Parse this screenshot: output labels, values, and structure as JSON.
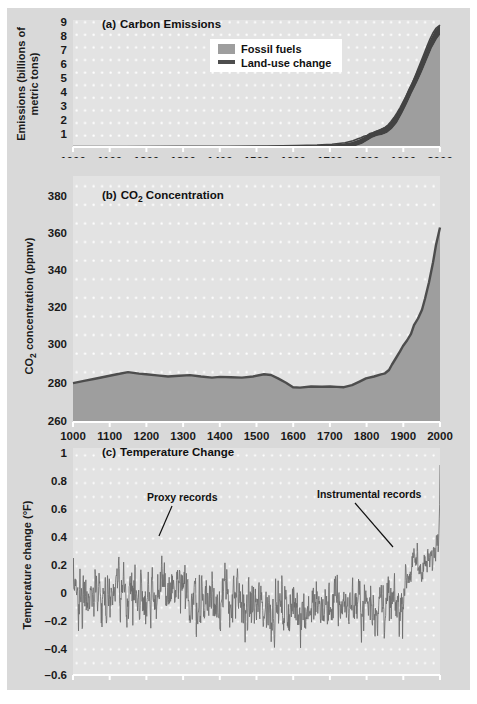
{
  "figure": {
    "background_color": "#d9d9d9",
    "plot_background_color": "#e3e3e3",
    "grid_color": "#ffffff",
    "axis_color": "#ffffff",
    "line_color": "#4d4d4d",
    "fill_color": "#9a9a9a",
    "dark_fill_color": "#3d3d3d"
  },
  "panel_a": {
    "title_prefix": "(a)",
    "title": "Carbon Emissions",
    "ylabel_line1": "Emissions (billions of",
    "ylabel_line2": "metric tons)",
    "yticks": [
      "9",
      "8",
      "7",
      "6",
      "5",
      "4",
      "3",
      "2",
      "1"
    ],
    "xticks": [
      "1000",
      "1100",
      "1200",
      "1300",
      "1400",
      "1500",
      "1600",
      "1700",
      "1800",
      "1900",
      "2000"
    ],
    "legend": [
      {
        "label": "Fossil fuels",
        "marker": "swatch",
        "color": "#9a9a9a"
      },
      {
        "label": "Land-use change",
        "marker": "line",
        "color": "#4d4d4d"
      }
    ]
  },
  "panel_b": {
    "title_prefix": "(b)",
    "title_main": "CO",
    "title_sub": "2",
    "title_rest": " Concentration",
    "ylabel_main": "CO",
    "ylabel_sub": "2",
    "ylabel_rest": " concentration (ppmv)",
    "yticks": [
      "380",
      "360",
      "340",
      "320",
      "300",
      "280",
      "260"
    ],
    "xticks": [
      "1000",
      "1100",
      "1200",
      "1300",
      "1400",
      "1500",
      "1600",
      "1700",
      "1800",
      "1900",
      "2000"
    ]
  },
  "panel_c": {
    "title_prefix": "(c)",
    "title": "Temperature Change",
    "ylabel": "Temperature change (°F)",
    "yticks": [
      "1",
      "0.8",
      "0.6",
      "0.4",
      "0.2",
      "0",
      "–0.2",
      "–0.4",
      "–0.6"
    ],
    "xticks": [
      "1000",
      "1100",
      "1200",
      "1300",
      "1400",
      "1500",
      "1600",
      "1700",
      "1800",
      "1900",
      "2000"
    ],
    "annotations": [
      {
        "label": "Proxy records"
      },
      {
        "label": "Instrumental records"
      }
    ]
  },
  "chart_data": [
    {
      "type": "area",
      "title": "(a) Carbon Emissions",
      "xlabel": "",
      "ylabel": "Emissions (billions of metric tons)",
      "xlim": [
        1000,
        2000
      ],
      "ylim": [
        0,
        9.5
      ],
      "grid": true,
      "legend_position": "top-center",
      "series": [
        {
          "name": "Land-use change",
          "x": [
            1000,
            1100,
            1200,
            1300,
            1400,
            1500,
            1600,
            1700,
            1750,
            1800,
            1820,
            1840,
            1850,
            1860,
            1870,
            1880,
            1890,
            1900,
            1910,
            1920,
            1930,
            1940,
            1950,
            1960,
            1970,
            1980,
            1990,
            2000
          ],
          "values": [
            0.03,
            0.03,
            0.04,
            0.04,
            0.04,
            0.05,
            0.05,
            0.06,
            0.08,
            0.12,
            0.16,
            0.25,
            0.32,
            0.42,
            0.5,
            0.6,
            0.7,
            0.85,
            1.0,
            1.15,
            1.25,
            1.4,
            1.5,
            1.6,
            1.8,
            1.9,
            2.0,
            2.1
          ]
        },
        {
          "name": "Fossil fuels",
          "x": [
            1000,
            1750,
            1800,
            1850,
            1870,
            1890,
            1900,
            1910,
            1920,
            1930,
            1940,
            1950,
            1960,
            1970,
            1980,
            1990,
            2000
          ],
          "values": [
            0,
            0,
            0.01,
            0.05,
            0.15,
            0.35,
            0.55,
            0.9,
            1.0,
            1.2,
            1.3,
            1.6,
            2.5,
            4.0,
            5.3,
            6.2,
            6.5
          ]
        }
      ],
      "total_top_2000": 8.0
    },
    {
      "type": "area",
      "title": "(b) CO2 Concentration",
      "xlabel": "",
      "ylabel": "CO2 concentration (ppmv)",
      "xlim": [
        1000,
        2000
      ],
      "ylim": [
        260,
        385
      ],
      "grid": true,
      "x": [
        1000,
        1030,
        1060,
        1090,
        1120,
        1150,
        1180,
        1200,
        1230,
        1260,
        1290,
        1320,
        1350,
        1380,
        1400,
        1430,
        1460,
        1490,
        1520,
        1540,
        1560,
        1580,
        1600,
        1620,
        1650,
        1680,
        1700,
        1720,
        1740,
        1760,
        1780,
        1800,
        1820,
        1840,
        1850,
        1860,
        1870,
        1880,
        1890,
        1900,
        1910,
        1920,
        1930,
        1940,
        1950,
        1960,
        1970,
        1980,
        1990,
        2000
      ],
      "values": [
        279.5,
        280.5,
        281.5,
        282.5,
        283.5,
        284.5,
        283.8,
        283.5,
        283.0,
        282.5,
        282.8,
        283.2,
        282.5,
        282.0,
        282.3,
        282.2,
        282.0,
        282.5,
        283.5,
        283.2,
        281.5,
        279.5,
        277.5,
        277.3,
        277.8,
        277.7,
        277.8,
        277.6,
        277.5,
        278.5,
        280.0,
        281.5,
        282.5,
        283.5,
        284.0,
        285.5,
        288.0,
        291.0,
        294.0,
        296.5,
        299.0,
        302.0,
        306.0,
        309.0,
        311.0,
        316.0,
        325.0,
        338.0,
        353.0,
        369.0
      ]
    },
    {
      "type": "line",
      "title": "(c) Temperature Change",
      "xlabel": "",
      "ylabel": "Temperature change (°F)",
      "xlim": [
        1000,
        2000
      ],
      "ylim": [
        -0.6,
        1.0
      ],
      "grid": true,
      "annotations": [
        "Proxy records",
        "Instrumental records"
      ],
      "description": "Noisy annual anomaly series oscillating roughly between -0.3 and +0.25 from 1000-1900, then rising sharply to ~0.9 by 2000",
      "baseline_mean_1000_1900": -0.05,
      "noise_amplitude": 0.2,
      "peak_2000": 0.88
    }
  ]
}
